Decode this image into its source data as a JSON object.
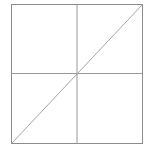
{
  "figure": {
    "name": "square-with-quadrant-lines-and-diagonal",
    "background_color": "#ffffff",
    "canvas": {
      "width": 153,
      "height": 155
    },
    "square": {
      "label": "outer-square",
      "x": 11.5,
      "y": 4.5,
      "width": 131,
      "height": 139,
      "stroke_color": "#8c8c8c",
      "stroke_width": 1,
      "fill": "none"
    },
    "lines": [
      {
        "label": "vertical-midline",
        "x1": 77,
        "y1": 4.5,
        "x2": 77,
        "y2": 143.5,
        "stroke_color": "#9a9a9a",
        "stroke_width": 1
      },
      {
        "label": "horizontal-midline",
        "x1": 11.5,
        "y1": 73.5,
        "x2": 142.5,
        "y2": 73.5,
        "stroke_color": "#9a9a9a",
        "stroke_width": 1
      },
      {
        "label": "diagonal-bottom-left-to-top-right",
        "x1": 11.5,
        "y1": 143.5,
        "x2": 142.5,
        "y2": 4.5,
        "stroke_color": "#a6a6a6",
        "stroke_width": 1
      }
    ]
  }
}
